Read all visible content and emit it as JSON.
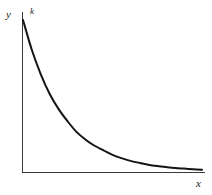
{
  "figure": {
    "background_color": "#ffffff",
    "axis_color": "#3a3a3a",
    "curve_color": "#141414",
    "label_color": "#1a1a1a"
  },
  "labels": {
    "y_axis": "y",
    "x_axis": "x",
    "intercept": "k"
  },
  "chart_data": {
    "type": "line",
    "title": "",
    "subtitle": "",
    "xlabel": "x",
    "ylabel": "y",
    "legend": [],
    "legend_position": "none",
    "grid": false,
    "xlim": [
      0,
      10
    ],
    "ylim": [
      0,
      1
    ],
    "xticks": [],
    "yticks": [],
    "xticklabels": [],
    "yticklabels": [],
    "annotations": [
      {
        "text": "k",
        "x": 0,
        "y": 1,
        "note": "y-intercept of the decaying exponential curve"
      }
    ],
    "series": [
      {
        "name": "exponential decay",
        "equation": "y = k * exp(-x)",
        "x": [
          0,
          0.5,
          1,
          1.5,
          2,
          2.5,
          3,
          3.5,
          4,
          4.5,
          5,
          5.5,
          6,
          6.5,
          7,
          7.5,
          8,
          8.5,
          9,
          9.5,
          10
        ],
        "y": [
          1.0,
          0.8,
          0.64,
          0.51,
          0.41,
          0.33,
          0.26,
          0.21,
          0.17,
          0.14,
          0.11,
          0.088,
          0.07,
          0.057,
          0.045,
          0.036,
          0.029,
          0.023,
          0.019,
          0.015,
          0.012
        ]
      }
    ]
  }
}
